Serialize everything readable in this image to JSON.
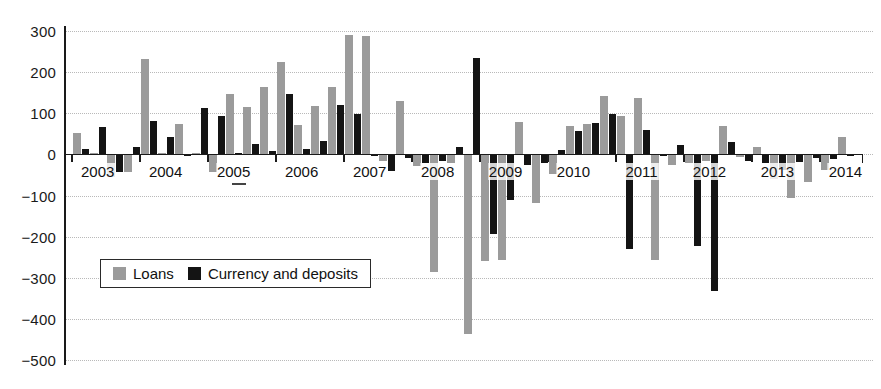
{
  "chart_data": {
    "type": "bar",
    "title": "",
    "subtitle": "",
    "xlabel": "",
    "ylabel": "",
    "ylim": [
      -500,
      300
    ],
    "ytick_step": 100,
    "yticks": [
      "300",
      "200",
      "100",
      "0",
      "-100",
      "-200",
      "-300",
      "-400",
      "-500"
    ],
    "grid": true,
    "legend_position": "inside-lower-left",
    "x_tick_labels": [
      "2003",
      "2004",
      "2005",
      "2006",
      "2007",
      "2008",
      "2009",
      "2010",
      "2011",
      "2012",
      "2013",
      "2014"
    ],
    "categories": [
      "2003Q1",
      "2003Q2",
      "2003Q3",
      "2003Q4",
      "2004Q1",
      "2004Q2",
      "2004Q3",
      "2004Q4",
      "2005Q1",
      "2005Q2",
      "2005Q3",
      "2005Q4",
      "2006Q1",
      "2006Q2",
      "2006Q3",
      "2006Q4",
      "2007Q1",
      "2007Q2",
      "2007Q3",
      "2007Q4",
      "2008Q1",
      "2008Q2",
      "2008Q3",
      "2008Q4",
      "2009Q1",
      "2009Q2",
      "2009Q3",
      "2009Q4",
      "2010Q1",
      "2010Q2",
      "2010Q3",
      "2010Q4",
      "2011Q1",
      "2011Q2",
      "2011Q3",
      "2011Q4",
      "2012Q1",
      "2012Q2",
      "2012Q3",
      "2012Q4",
      "2013Q1",
      "2013Q2",
      "2013Q3",
      "2013Q4",
      "2014Q1",
      "2014Q2"
    ],
    "series": [
      {
        "name": "Loans",
        "color": "#9b9b9b",
        "values": [
          52,
          4,
          -55,
          -42,
          232,
          3,
          73,
          3,
          -42,
          147,
          116,
          163,
          224,
          72,
          117,
          164,
          290,
          289,
          -17,
          131,
          -28,
          -285,
          -20,
          -437,
          -260,
          -258,
          78,
          -118,
          -48,
          68,
          74,
          143,
          93,
          137,
          -258,
          -26,
          -22,
          -16,
          70,
          -7,
          18,
          -60,
          -105,
          -66,
          -38,
          42
        ]
      },
      {
        "name": "Currency and deposits",
        "color": "#141414",
        "values": [
          14,
          66,
          -43,
          18,
          82,
          42,
          -3,
          112,
          94,
          4,
          26,
          8,
          146,
          12,
          33,
          119,
          98,
          -4,
          -40,
          -10,
          -22,
          -17,
          19,
          235,
          -193,
          -110,
          -26,
          -21,
          11,
          56,
          76,
          98,
          -230,
          60,
          -5,
          22,
          -222,
          -333,
          31,
          -16,
          -20,
          -38,
          -19,
          -8,
          -12,
          -5
        ]
      }
    ]
  },
  "legend": {
    "items": [
      {
        "label": "Loans",
        "swatch": "loans-swatch"
      },
      {
        "label": "Currency and deposits",
        "swatch": "currency-deposits-swatch"
      }
    ]
  }
}
